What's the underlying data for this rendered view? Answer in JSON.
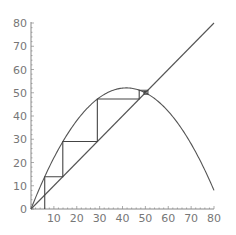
{
  "chart_data": {
    "type": "line",
    "title": "",
    "xlabel": "",
    "ylabel": "",
    "xlim": [
      0,
      80
    ],
    "ylim": [
      0,
      80
    ],
    "grid": false,
    "legend": null,
    "x_ticks": [
      "10",
      "20",
      "30",
      "40",
      "50",
      "60",
      "70",
      "80"
    ],
    "y_ticks": [
      "0",
      "10",
      "20",
      "30",
      "40",
      "50",
      "60",
      "70",
      "80"
    ],
    "series": [
      {
        "name": "parabola f(x) = 2.5x - 0.03x^2",
        "type": "line",
        "x": [
          0,
          10,
          20,
          30,
          40,
          50,
          60,
          70,
          80
        ],
        "values": [
          0,
          22,
          38,
          48,
          52,
          50,
          42,
          28,
          8
        ]
      },
      {
        "name": "identity y = x",
        "type": "line",
        "x": [
          0,
          80
        ],
        "values": [
          0,
          80
        ]
      },
      {
        "name": "cobweb",
        "type": "line",
        "points": [
          [
            6,
            0
          ],
          [
            6,
            13.9
          ],
          [
            13.9,
            13.9
          ],
          [
            13.9,
            29
          ],
          [
            29,
            29
          ],
          [
            29,
            47.3
          ],
          [
            47.3,
            47.3
          ],
          [
            47.3,
            51.1
          ],
          [
            51.1,
            51.1
          ],
          [
            51.1,
            49.4
          ],
          [
            49.4,
            49.4
          ],
          [
            49.4,
            50.5
          ],
          [
            50.5,
            50.5
          ]
        ]
      }
    ],
    "annotations": []
  },
  "colors": {
    "line": "#555555",
    "axis": "#888888",
    "text": "#777777"
  }
}
